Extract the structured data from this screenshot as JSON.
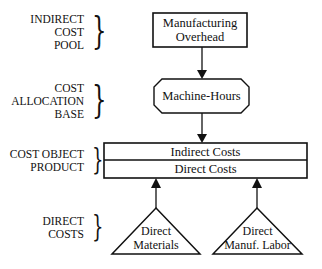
{
  "categories": [
    {
      "id": "indirect-cost-pool",
      "lines": [
        "INDIRECT",
        "COST",
        "POOL"
      ]
    },
    {
      "id": "cost-allocation-base",
      "lines": [
        "COST",
        "ALLOCATION",
        "BASE"
      ]
    },
    {
      "id": "cost-object",
      "lines": [
        "COST OBJECT",
        "PRODUCT"
      ]
    },
    {
      "id": "direct-costs",
      "lines": [
        "DIRECT",
        "COSTS"
      ]
    }
  ],
  "nodes": {
    "overhead": {
      "lines": [
        "Manufacturing",
        "Overhead"
      ],
      "shape": "rectangle"
    },
    "machine_hours": {
      "label": "Machine-Hours",
      "shape": "octagon"
    },
    "cost_object": {
      "top": "Indirect Costs",
      "bottom": "Direct Costs",
      "shape": "split-rectangle"
    },
    "direct_materials": {
      "lines": [
        "Direct",
        "Materials"
      ],
      "shape": "triangle"
    },
    "direct_labor": {
      "lines": [
        "Direct",
        "Manuf. Labor"
      ],
      "shape": "triangle"
    }
  },
  "edges": [
    {
      "from": "overhead",
      "to": "machine_hours"
    },
    {
      "from": "machine_hours",
      "to": "cost_object"
    },
    {
      "from": "direct_materials",
      "to": "cost_object"
    },
    {
      "from": "direct_labor",
      "to": "cost_object"
    }
  ],
  "braces": {
    "glyph": "}"
  },
  "colors": {
    "stroke": "#111111",
    "background": "#ffffff"
  }
}
